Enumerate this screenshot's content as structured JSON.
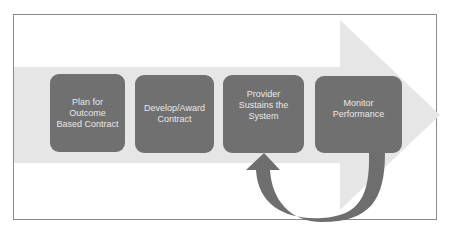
{
  "diagram": {
    "type": "process-flow",
    "colors": {
      "background": "#ffffff",
      "frame_border": "#8a8a8a",
      "big_arrow": "#e6e6e6",
      "step_box": "#707070",
      "step_text": "#e8e8e8",
      "loop_arrow": "#6e6e6e"
    },
    "steps": [
      {
        "label": "Plan for Outcome Based Contract",
        "lines": [
          "Plan for",
          "Outcome",
          "Based Contract"
        ]
      },
      {
        "label": "Develop/Award Contract",
        "lines": [
          "Develop/Award",
          "Contract"
        ]
      },
      {
        "label": "Provider Sustains the System",
        "lines": [
          "Provider",
          "Sustains the",
          "System"
        ]
      },
      {
        "label": "Monitor Performance",
        "lines": [
          "Monitor",
          "Performance"
        ]
      }
    ],
    "loop": {
      "from": "Monitor Performance",
      "to": "Provider Sustains the System"
    }
  }
}
